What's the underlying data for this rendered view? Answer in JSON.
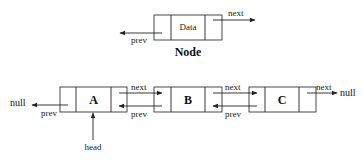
{
  "legend_node": {
    "data_label": "Data",
    "next_label": "next",
    "prev_label": "prev",
    "caption": "Node"
  },
  "list": {
    "nodes": [
      {
        "label": "A"
      },
      {
        "label": "B"
      },
      {
        "label": "C"
      }
    ],
    "null_left": "null",
    "null_right": "null",
    "head_label": "head",
    "links": {
      "a_prev": "prev",
      "ab_next": "next",
      "ab_prev": "prev",
      "bc_next": "next",
      "bc_prev": "prev",
      "c_next": "next"
    }
  }
}
